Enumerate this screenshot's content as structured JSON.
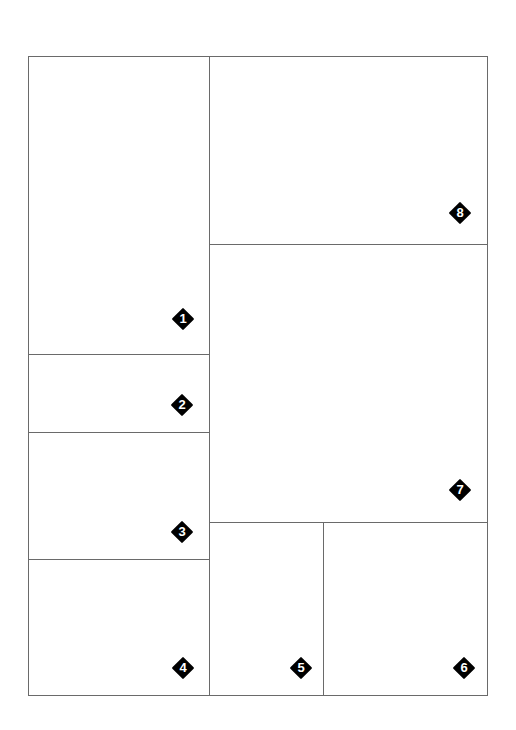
{
  "layout": {
    "title": "Comic page panel layout",
    "frame": {
      "x": 28,
      "y": 56,
      "w": 459,
      "h": 639
    },
    "line_color": "#6a6a6a",
    "badge_color": "#000000",
    "badge_text_color": "#ffffff"
  },
  "panels": [
    {
      "id": "1",
      "label": "1",
      "x": 28,
      "y": 56,
      "w": 182,
      "h": 299,
      "badge": {
        "x": 183,
        "y": 319
      }
    },
    {
      "id": "2",
      "label": "2",
      "x": 28,
      "y": 354,
      "w": 182,
      "h": 79,
      "badge": {
        "x": 182,
        "y": 405
      }
    },
    {
      "id": "3",
      "label": "3",
      "x": 28,
      "y": 432,
      "w": 182,
      "h": 128,
      "badge": {
        "x": 182,
        "y": 532
      }
    },
    {
      "id": "4",
      "label": "4",
      "x": 28,
      "y": 559,
      "w": 182,
      "h": 137,
      "badge": {
        "x": 183,
        "y": 668
      }
    },
    {
      "id": "5",
      "label": "5",
      "x": 209,
      "y": 522,
      "w": 115,
      "h": 174,
      "badge": {
        "x": 301,
        "y": 668
      }
    },
    {
      "id": "6",
      "label": "6",
      "x": 323,
      "y": 522,
      "w": 165,
      "h": 174,
      "badge": {
        "x": 464,
        "y": 668
      }
    },
    {
      "id": "7",
      "label": "7",
      "x": 209,
      "y": 244,
      "w": 279,
      "h": 279,
      "badge": {
        "x": 460,
        "y": 490
      }
    },
    {
      "id": "8",
      "label": "8",
      "x": 209,
      "y": 56,
      "w": 279,
      "h": 189,
      "badge": {
        "x": 460,
        "y": 213
      }
    }
  ]
}
